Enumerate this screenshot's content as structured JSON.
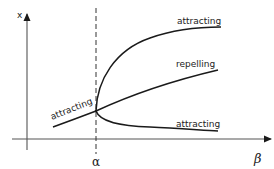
{
  "diagram": {
    "type": "pitchfork-bifurcation",
    "axes": {
      "y_label": "x",
      "x_label": "β"
    },
    "critical_value": {
      "label": "α"
    },
    "branches": [
      {
        "id": "left",
        "label": "attracting"
      },
      {
        "id": "upper",
        "label": "attracting"
      },
      {
        "id": "middle",
        "label": "repelling"
      },
      {
        "id": "lower",
        "label": "attracting"
      }
    ],
    "colors": {
      "line": "#1a1a1a",
      "axis": "#555555",
      "background": "#ffffff"
    }
  }
}
